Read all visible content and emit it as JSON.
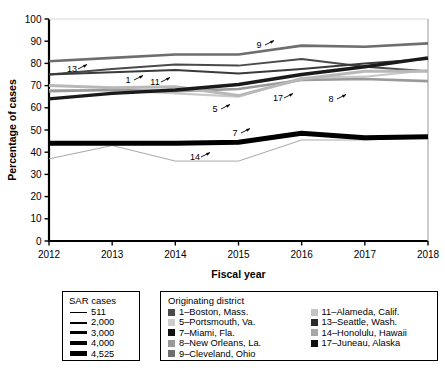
{
  "chart_data": {
    "type": "line",
    "title": "",
    "xlabel": "Fiscal year",
    "ylabel": "Percentage of cases",
    "x": [
      2012,
      2013,
      2014,
      2015,
      2016,
      2017,
      2018
    ],
    "xlim": [
      2012,
      2018
    ],
    "ylim": [
      0,
      100
    ],
    "ytick_step": 10,
    "yticks": [
      0,
      10,
      20,
      30,
      40,
      50,
      60,
      70,
      80,
      90,
      100
    ],
    "xticks": [
      2012,
      2013,
      2014,
      2015,
      2016,
      2017,
      2018
    ],
    "grid": false,
    "legend_position": "below",
    "series": [
      {
        "name": "9",
        "label": "9–Cleveland, Ohio",
        "color": "#6e6e6e",
        "width": 2.6,
        "sar_cases": "3,000",
        "values": [
          81,
          82.5,
          84,
          84,
          88,
          87.5,
          89
        ]
      },
      {
        "name": "13",
        "label": "13–Seattle, Wash.",
        "color": "#4a4a4a",
        "width": 2.0,
        "sar_cases": "2,000",
        "values": [
          75,
          77.5,
          79.5,
          79,
          82,
          78.5,
          76.5
        ]
      },
      {
        "name": "1",
        "label": "1–Boston, Mass.",
        "color": "#3a3a3a",
        "width": 2.0,
        "sar_cases": "2,000",
        "values": [
          75,
          76,
          77,
          75.5,
          77.5,
          80,
          82
        ]
      },
      {
        "name": "17",
        "label": "17–Juneau, Alaska",
        "color": "#1a1a1a",
        "width": 3.4,
        "sar_cases": "4,000",
        "values": [
          64,
          66.5,
          68,
          70.5,
          75,
          78.5,
          82.5
        ]
      },
      {
        "name": "11",
        "label": "11–Alameda, Calif.",
        "color": "#b8b8b8",
        "width": 3.0,
        "sar_cases": "3,000",
        "values": [
          70,
          69,
          69.5,
          65.5,
          73,
          76.5,
          76.5
        ]
      },
      {
        "name": "5",
        "label": "5–Portsmouth, Va.",
        "color": "#c9c9c9",
        "width": 2.2,
        "sar_cases": "2,000",
        "values": [
          68,
          68,
          66.5,
          65,
          73.5,
          74,
          77
        ]
      },
      {
        "name": "8",
        "label": "8–New Orleans, La.",
        "color": "#9a9a9a",
        "width": 2.6,
        "sar_cases": "3,000",
        "values": [
          67.5,
          68,
          67.5,
          68.5,
          72.5,
          73,
          72
        ]
      },
      {
        "name": "7",
        "label": "7–Miami, Fla.",
        "color": "#000000",
        "width": 5.0,
        "sar_cases": "4,525",
        "values": [
          44,
          44,
          44,
          44.5,
          48.5,
          46.5,
          47
        ]
      },
      {
        "name": "14",
        "label": "14–Honolulu, Hawaii",
        "color": "#a8a8a8",
        "width": 1.0,
        "sar_cases": "511",
        "values": [
          37,
          43,
          36,
          36,
          45.5,
          45.5,
          46.5
        ]
      }
    ],
    "annotations": [
      {
        "label": "13",
        "x": 72,
        "y": 72
      },
      {
        "label": "1",
        "x": 128,
        "y": 83
      },
      {
        "label": "11",
        "x": 155,
        "y": 85
      },
      {
        "label": "5",
        "x": 215,
        "y": 112
      },
      {
        "label": "9",
        "x": 259,
        "y": 48
      },
      {
        "label": "17",
        "x": 278,
        "y": 101
      },
      {
        "label": "8",
        "x": 331,
        "y": 102
      },
      {
        "label": "7",
        "x": 235,
        "y": 136
      },
      {
        "label": "14",
        "x": 195,
        "y": 160
      }
    ]
  },
  "thickness_legend": {
    "title": "SAR cases",
    "items": [
      {
        "value": "511",
        "px": 1
      },
      {
        "value": "2,000",
        "px": 2
      },
      {
        "value": "3,000",
        "px": 3
      },
      {
        "value": "4,000",
        "px": 4
      },
      {
        "value": "4,525",
        "px": 5
      }
    ]
  },
  "district_legend": {
    "title": "Originating district",
    "column1": [
      {
        "label": "1–Boston, Mass.",
        "color": "#4a4a4a"
      },
      {
        "label": "5–Portsmouth, Va.",
        "color": "#cccccc"
      },
      {
        "label": "7–Miami, Fla.",
        "color": "#111111"
      },
      {
        "label": "8–New Orleans, La.",
        "color": "#9a9a9a"
      },
      {
        "label": "9–Cleveland, Ohio",
        "color": "#6e6e6e"
      }
    ],
    "column2": [
      {
        "label": "11–Alameda, Calif.",
        "color": "#c4c4c4"
      },
      {
        "label": "13–Seattle, Wash.",
        "color": "#2b2b2b"
      },
      {
        "label": "14–Honolulu, Hawaii",
        "color": "#a8a8a8"
      },
      {
        "label": "17–Juneau, Alaska",
        "color": "#111111"
      }
    ]
  }
}
